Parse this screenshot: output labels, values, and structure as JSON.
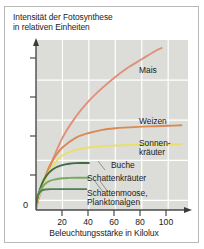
{
  "chart_data": {
    "type": "line",
    "title": "Intensität der Fotosynthese in relativen Einheiten",
    "title_line1": "Intensität der Fotosynthese",
    "title_line2": "in relativen Einheiten",
    "xlabel": "Beleuchtungsstärke in Kilolux",
    "ylabel": "Intensität der Fotosynthese in relativen Einheiten",
    "xticks": [
      20,
      40,
      60,
      80,
      100
    ],
    "xtick_labels": [
      "20",
      "40",
      "60",
      "80",
      "100"
    ],
    "xlim": [
      0,
      115
    ],
    "ylim": [
      -0.6,
      10
    ],
    "yticks": [
      0,
      2.5,
      5,
      7.5
    ],
    "ytick_labels": [
      "0",
      "",
      "",
      ""
    ],
    "origin_label": "0",
    "grid": true,
    "grid_color": "#ffffff",
    "plot_background": "#dcdcd8",
    "legend_position": "inline-right",
    "series": [
      {
        "name": "Mais",
        "label": "Mais",
        "color": "#e0907a",
        "x": [
          0,
          2,
          5,
          10,
          20,
          30,
          40,
          50,
          60,
          70,
          80,
          90,
          95
        ],
        "values": [
          -0.6,
          0.1,
          0.8,
          2.0,
          3.9,
          5.2,
          6.2,
          7.0,
          7.7,
          8.3,
          8.8,
          9.3,
          9.5
        ]
      },
      {
        "name": "Weizen",
        "label": "Weizen",
        "color": "#d98a55",
        "x": [
          0,
          2,
          5,
          10,
          15,
          20,
          30,
          40,
          50,
          60,
          70,
          80,
          90,
          100,
          110
        ],
        "values": [
          -0.5,
          0.2,
          1.0,
          2.1,
          2.8,
          3.3,
          3.9,
          4.2,
          4.4,
          4.5,
          4.55,
          4.6,
          4.62,
          4.65,
          4.68
        ]
      },
      {
        "name": "Sonnenkräuter",
        "label": "Sonnen-\nkräuter",
        "color": "#e8e06a",
        "x": [
          0,
          2,
          5,
          10,
          15,
          20,
          25,
          30,
          40,
          50,
          60,
          70,
          80,
          90,
          100,
          110
        ],
        "values": [
          -0.4,
          0.2,
          0.9,
          1.8,
          2.4,
          2.8,
          3.0,
          3.15,
          3.3,
          3.38,
          3.42,
          3.45,
          3.47,
          3.48,
          3.5,
          3.5
        ]
      },
      {
        "name": "Buche",
        "label": "Buche",
        "color": "#3f6b45",
        "x": [
          0,
          1,
          3,
          6,
          10,
          15,
          20,
          25,
          30,
          35,
          40
        ],
        "values": [
          -0.35,
          0.1,
          0.7,
          1.3,
          1.75,
          2.05,
          2.2,
          2.28,
          2.32,
          2.33,
          2.33
        ]
      },
      {
        "name": "Schattenkräuter",
        "label": "Schattenkräuter",
        "color": "#7ba95e",
        "x": [
          0,
          1,
          3,
          6,
          10,
          15,
          20,
          25,
          30,
          35,
          40
        ],
        "values": [
          -0.3,
          0.15,
          0.6,
          0.95,
          1.2,
          1.32,
          1.38,
          1.4,
          1.41,
          1.41,
          1.41
        ]
      },
      {
        "name": "Schattenmoose, Planktonalgen",
        "label": "Schattenmoose,\nPlanktonalgen",
        "color": "#4e7f57",
        "x": [
          0,
          1,
          2,
          4,
          7,
          12,
          18,
          25,
          32,
          38
        ],
        "values": [
          -0.25,
          0.15,
          0.4,
          0.6,
          0.68,
          0.7,
          0.7,
          0.7,
          0.7,
          0.7
        ]
      }
    ],
    "annotations": [
      {
        "text": "Mais",
        "series": "Mais"
      },
      {
        "text": "Weizen",
        "series": "Weizen"
      },
      {
        "text": "Sonnen-kräuter",
        "series": "Sonnenkräuter"
      },
      {
        "text": "Buche",
        "series": "Buche"
      },
      {
        "text": "Schattenkräuter",
        "series": "Schattenkräuter"
      },
      {
        "text": "Schattenmoose, Planktonalgen",
        "series": "Schattenmoose, Planktonalgen"
      }
    ]
  },
  "labels": {
    "mais": "Mais",
    "weizen": "Weizen",
    "sonnenkraeuter_l1": "Sonnen-",
    "sonnenkraeuter_l2": "kräuter",
    "buche": "Buche",
    "schattenkraeuter": "Schattenkräuter",
    "schattenmoose_l1": "Schattenmoose,",
    "schattenmoose_l2": "Planktonalgen"
  },
  "axis": {
    "x_label": "Beleuchtungsstärke in Kilolux",
    "zero": "0",
    "t20": "20",
    "t40": "40",
    "t60": "60",
    "t80": "80",
    "t100": "100"
  },
  "title": {
    "line1": "Intensität der Fotosynthese",
    "line2": "in relativen Einheiten"
  }
}
